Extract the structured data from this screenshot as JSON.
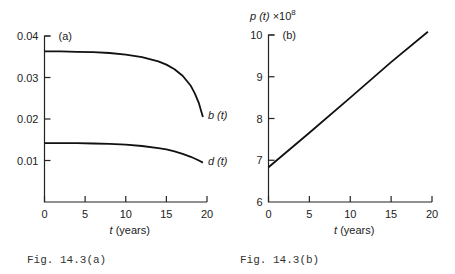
{
  "chart_data": [
    {
      "id": "a",
      "type": "line",
      "panel_label": "(a)",
      "title": "",
      "xlabel": "t (years)",
      "ylabel": "",
      "xlim": [
        0,
        20
      ],
      "ylim": [
        0,
        0.04
      ],
      "xticks": [
        0,
        5,
        10,
        15,
        20
      ],
      "xtick_labels": [
        "0",
        "5",
        "10",
        "15",
        "20"
      ],
      "yticks": [
        0.01,
        0.02,
        0.03,
        0.04
      ],
      "ytick_labels": [
        "0.01",
        "0.02",
        "0.03",
        "0.04"
      ],
      "grid": false,
      "caption": "Fig. 14.3(a)",
      "series": [
        {
          "name": "b(t)",
          "label": "b (t)",
          "x": [
            0,
            2,
            4,
            6,
            8,
            10,
            12,
            14,
            15,
            16,
            17,
            18,
            18.5,
            19,
            19.5
          ],
          "y": [
            0.0363,
            0.0363,
            0.0362,
            0.0361,
            0.0359,
            0.0355,
            0.0349,
            0.0339,
            0.0331,
            0.032,
            0.0304,
            0.028,
            0.0262,
            0.0238,
            0.0205
          ]
        },
        {
          "name": "d(t)",
          "label": "d (t)",
          "x": [
            0,
            2,
            4,
            6,
            8,
            10,
            12,
            14,
            15,
            16,
            17,
            18,
            19,
            19.5
          ],
          "y": [
            0.0142,
            0.0142,
            0.0142,
            0.0141,
            0.014,
            0.0138,
            0.0135,
            0.013,
            0.0127,
            0.0122,
            0.0116,
            0.0109,
            0.01,
            0.0095
          ]
        }
      ]
    },
    {
      "id": "b",
      "type": "line",
      "panel_label": "(b)",
      "title": "",
      "xlabel": "t (years)",
      "ylabel": "p (t) ×10⁸",
      "xlim": [
        0,
        20
      ],
      "ylim": [
        6,
        10
      ],
      "xticks": [
        0,
        5,
        10,
        15,
        20
      ],
      "xtick_labels": [
        "0",
        "5",
        "10",
        "15",
        "20"
      ],
      "yticks": [
        6,
        7,
        8,
        9,
        10
      ],
      "ytick_labels": [
        "6",
        "7",
        "8",
        "9",
        "10"
      ],
      "grid": false,
      "caption": "Fig. 14.3(b)",
      "series": [
        {
          "name": "p(t)",
          "label": "",
          "x": [
            0,
            5,
            10,
            15,
            19.5
          ],
          "y": [
            6.83,
            7.66,
            8.5,
            9.35,
            10.08
          ]
        }
      ]
    }
  ]
}
